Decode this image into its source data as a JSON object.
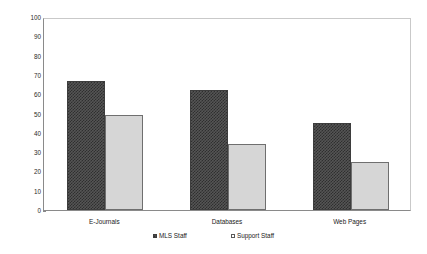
{
  "chart_data": {
    "type": "bar",
    "title": "",
    "xlabel": "",
    "ylabel": "Number of Libraries Responding",
    "categories": [
      "E-Journals",
      "Databases",
      "Web Pages"
    ],
    "series": [
      {
        "name": "MLS Staff",
        "values": [
          67,
          62,
          45
        ],
        "color": "#4a4a4a",
        "pattern": "crosshatch"
      },
      {
        "name": "Support Staff",
        "values": [
          49,
          34,
          25
        ],
        "color": "#d6d6d6",
        "pattern": "solid"
      }
    ],
    "ylim": [
      0,
      100
    ],
    "yticks": [
      100,
      90,
      80,
      70,
      60,
      50,
      40,
      30,
      20,
      10,
      0
    ],
    "grid": false,
    "legend_position": "bottom"
  }
}
